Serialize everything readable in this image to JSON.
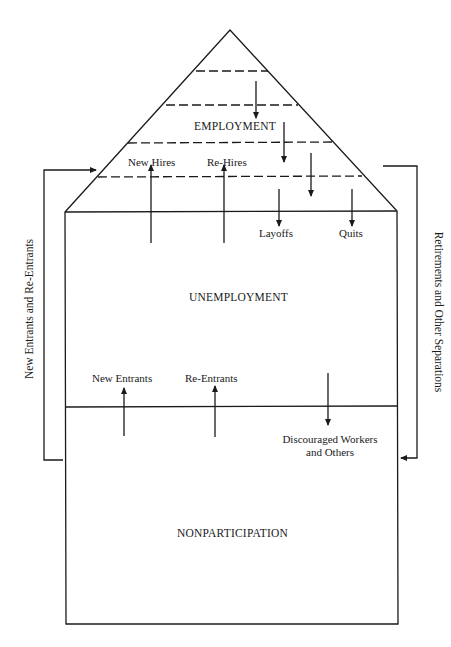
{
  "diagram": {
    "type": "labor-market-flow-house",
    "colors": {
      "line": "#1a1a1a",
      "background": "#ffffff"
    },
    "states": {
      "employment": "EMPLOYMENT",
      "unemployment": "UNEMPLOYMENT",
      "nonparticipation": "NONPARTICIPATION"
    },
    "flows": {
      "new_hires": "New Hires",
      "re_hires": "Re-Hires",
      "layoffs": "Layoffs",
      "quits": "Quits",
      "new_entrants": "New Entrants",
      "re_entrants": "Re-Entrants",
      "discouraged_line1": "Discouraged Workers",
      "discouraged_line2": "and Others"
    },
    "side_flows": {
      "left": "New Entrants and Re-Entrants",
      "right": "Retirements and Other Separations"
    }
  }
}
